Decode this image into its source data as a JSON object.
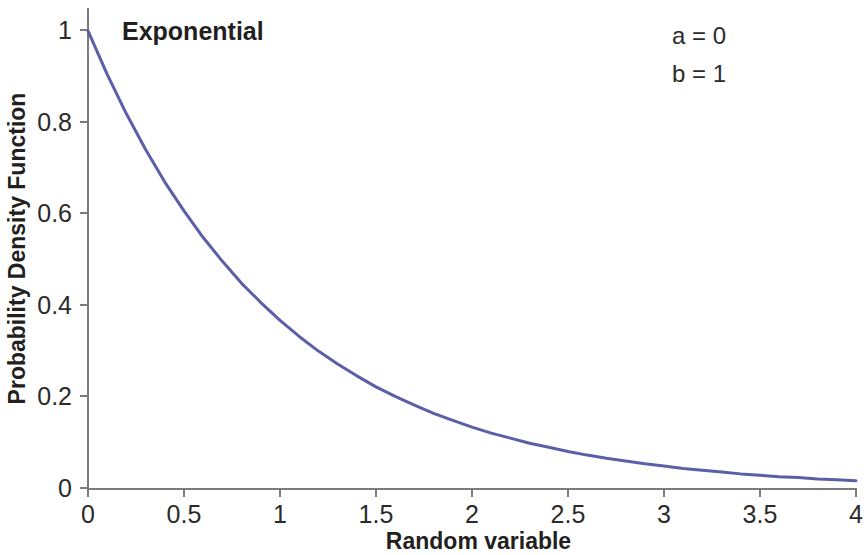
{
  "chart_data": {
    "type": "line",
    "title": "Exponential",
    "xlabel": "Random variable",
    "ylabel": "Probability Density Function",
    "xlim": [
      0,
      4
    ],
    "ylim": [
      0,
      1.05
    ],
    "grid": false,
    "legend": null,
    "xticks": [
      "0",
      "0.5",
      "1",
      "1.5",
      "2",
      "2.5",
      "3",
      "3.5",
      "4"
    ],
    "xtick_values": [
      0,
      0.5,
      1,
      1.5,
      2,
      2.5,
      3,
      3.5,
      4
    ],
    "yticks": [
      "0",
      "0.2",
      "0.4",
      "0.6",
      "0.8",
      "1"
    ],
    "ytick_values": [
      0,
      0.2,
      0.4,
      0.6,
      0.8,
      1
    ],
    "annotations": [
      {
        "name": "location-parameter",
        "text": "a = 0"
      },
      {
        "name": "scale-parameter",
        "text": "b = 1"
      }
    ],
    "series": [
      {
        "name": "Exponential PDF",
        "color": "#5b5fa8",
        "line_width": 3,
        "formula": "f(x) = exp(-x)",
        "x": [
          0,
          0.1,
          0.2,
          0.3,
          0.4,
          0.5,
          0.6,
          0.7,
          0.8,
          0.9,
          1,
          1.1,
          1.2,
          1.3,
          1.4,
          1.5,
          1.6,
          1.7,
          1.8,
          1.9,
          2,
          2.1,
          2.2,
          2.3,
          2.4,
          2.5,
          2.6,
          2.7,
          2.8,
          2.9,
          3,
          3.1,
          3.2,
          3.3,
          3.4,
          3.5,
          3.6,
          3.7,
          3.8,
          3.9,
          4
        ],
        "y": [
          1,
          0.905,
          0.819,
          0.741,
          0.67,
          0.607,
          0.549,
          0.497,
          0.449,
          0.407,
          0.368,
          0.333,
          0.301,
          0.273,
          0.247,
          0.223,
          0.202,
          0.183,
          0.165,
          0.15,
          0.135,
          0.122,
          0.111,
          0.1,
          0.091,
          0.082,
          0.074,
          0.067,
          0.061,
          0.055,
          0.05,
          0.045,
          0.041,
          0.037,
          0.033,
          0.03,
          0.027,
          0.025,
          0.022,
          0.02,
          0.018
        ]
      }
    ]
  },
  "colors": {
    "curve": "#5b5fa8",
    "axis": "#7b7b7b",
    "text": "#231f20",
    "background": "#ffffff"
  }
}
